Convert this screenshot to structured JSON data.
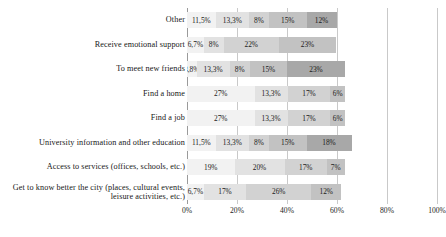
{
  "chart_data": {
    "type": "bar",
    "orientation": "horizontal",
    "stacked": true,
    "title": "",
    "xlabel": "",
    "ylabel": "",
    "xlim": [
      0,
      100
    ],
    "grid": true,
    "legend": "none",
    "tick_labels": [
      "0%",
      "20%",
      "40%",
      "60%",
      "80%",
      "100%"
    ],
    "tick_values": [
      0,
      20,
      40,
      60,
      80,
      100
    ],
    "categories": [
      "Other",
      "Receive emotional support",
      "To meet new friends",
      "Find a home",
      "Find a job",
      "University information and other education",
      "Access to services (offices, schools, etc.)",
      "Get to know better the city (places, cultural events, leisure activities, etc.)"
    ],
    "segment_colors": [
      "#f2f2f2",
      "#e2e2e2",
      "#d2d2d2",
      "#c2c2c2",
      "#a8a8a8"
    ],
    "rows": [
      {
        "category": "Other",
        "values": [
          11.5,
          13.3,
          8,
          15,
          12
        ],
        "labels": [
          "11,5%",
          "13,3%",
          "8%",
          "15%",
          "12%"
        ],
        "total": 59.8
      },
      {
        "category": "Receive emotional support",
        "values": [
          6.7,
          8,
          22,
          23
        ],
        "labels": [
          "6,7%",
          "8%",
          "22%",
          "23%"
        ],
        "total": 59.7
      },
      {
        "category": "To meet new friends",
        "values": [
          3.8,
          13.3,
          8,
          15,
          23
        ],
        "labels": [
          "3,8%",
          "13,3%",
          "8%",
          "15%",
          "23%"
        ],
        "total": 63.1
      },
      {
        "category": "Find a home",
        "values": [
          27,
          13.3,
          17,
          6
        ],
        "labels": [
          "27%",
          "13,3%",
          "17%",
          "6%"
        ],
        "total": 63.3
      },
      {
        "category": "Find a job",
        "values": [
          27,
          13.3,
          17,
          6
        ],
        "labels": [
          "27%",
          "13,3%",
          "17%",
          "6%"
        ],
        "total": 63.3
      },
      {
        "category": "University information and other education",
        "values": [
          11.5,
          13.3,
          8,
          15,
          18
        ],
        "labels": [
          "11,5%",
          "13,3%",
          "8%",
          "15%",
          "18%"
        ],
        "total": 65.8
      },
      {
        "category": "Access to services (offices, schools, etc.)",
        "values": [
          19,
          20,
          17,
          7
        ],
        "labels": [
          "19%",
          "20%",
          "17%",
          "7%"
        ],
        "total": 63
      },
      {
        "category": "Get to know better the city (places, cultural events, leisure activities, etc.)",
        "values": [
          6.7,
          17,
          26,
          12
        ],
        "labels": [
          "6,7%",
          "17%",
          "26%",
          "12%"
        ],
        "total": 61.7
      }
    ]
  },
  "footnote": ""
}
